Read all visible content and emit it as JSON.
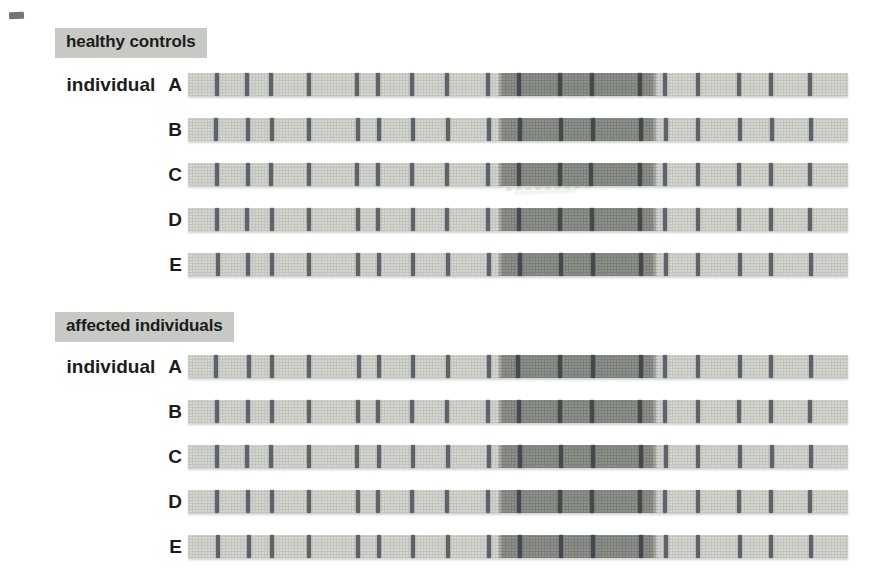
{
  "colors": {
    "page_bg": "#ffffff",
    "label_band_bg": "#c7c9c5",
    "text": "#1c1c1c",
    "bar_light": "#d4d6d0",
    "bar_halftone_dot": "rgba(70,75,66,0.13)",
    "block_dark": "#8e918c",
    "block_halftone_dot": "rgba(25,30,26,0.16)",
    "tick_light_region": "#5e6368",
    "tick_dark_region": "#45494d",
    "bar_shadow": "rgba(110,112,106,0.3)"
  },
  "sections": [
    {
      "label": "healthy controls",
      "row_prefix": "individual",
      "rows": [
        {
          "label": "A",
          "light_ticks_pct": [
            4.4,
            9.0,
            12.6,
            18.3,
            25.6,
            28.8,
            34.0,
            39.3,
            45.5,
            72.3,
            77.2,
            83.5,
            88.4,
            94.3
          ],
          "block": {
            "start_pct": 46.9,
            "end_pct": 71.0,
            "ticks_pct": [
              50.2,
              56.4,
              61.2,
              68.5
            ]
          }
        },
        {
          "label": "B",
          "light_ticks_pct": [
            4.3,
            9.1,
            12.7,
            18.4,
            25.7,
            28.9,
            34.1,
            39.4,
            45.6,
            72.4,
            77.3,
            83.6,
            88.5,
            94.4
          ],
          "block": {
            "start_pct": 47.0,
            "end_pct": 71.1,
            "ticks_pct": [
              50.3,
              56.5,
              61.3,
              68.6
            ]
          }
        },
        {
          "label": "C",
          "light_ticks_pct": [
            4.4,
            9.1,
            12.6,
            18.3,
            25.6,
            28.8,
            34.0,
            39.3,
            45.5,
            72.3,
            77.2,
            83.5,
            88.3,
            94.3
          ],
          "block": {
            "start_pct": 46.9,
            "end_pct": 71.0,
            "ticks_pct": [
              50.2,
              56.4,
              61.1,
              68.5
            ]
          }
        },
        {
          "label": "D",
          "light_ticks_pct": [
            4.4,
            9.0,
            12.7,
            18.3,
            25.7,
            28.8,
            34.1,
            39.3,
            45.5,
            72.3,
            77.2,
            83.5,
            88.4,
            94.3
          ],
          "block": {
            "start_pct": 46.9,
            "end_pct": 71.0,
            "ticks_pct": [
              50.2,
              56.3,
              61.2,
              68.5
            ]
          }
        },
        {
          "label": "E",
          "light_ticks_pct": [
            4.5,
            9.1,
            12.7,
            18.4,
            25.7,
            28.9,
            34.1,
            39.4,
            45.6,
            72.4,
            77.2,
            83.6,
            88.4,
            94.4
          ],
          "block": {
            "start_pct": 47.0,
            "end_pct": 71.1,
            "ticks_pct": [
              50.3,
              56.5,
              61.3,
              68.6
            ]
          }
        }
      ]
    },
    {
      "label": "affected individuals",
      "row_prefix": "individual",
      "rows": [
        {
          "label": "A",
          "light_ticks_pct": [
            4.3,
            9.2,
            12.8,
            18.4,
            25.9,
            28.9,
            34.1,
            39.4,
            45.6,
            72.3,
            77.2,
            83.6,
            88.4,
            94.4
          ],
          "block": {
            "start_pct": 47.0,
            "end_pct": 71.0,
            "ticks_pct": [
              50.0,
              56.4,
              61.3,
              68.6
            ]
          }
        },
        {
          "label": "B",
          "light_ticks_pct": [
            4.4,
            9.1,
            12.7,
            18.3,
            25.7,
            28.8,
            34.0,
            39.3,
            45.5,
            72.3,
            77.2,
            83.5,
            88.4,
            94.3
          ],
          "block": {
            "start_pct": 46.9,
            "end_pct": 71.0,
            "ticks_pct": [
              50.2,
              56.4,
              61.2,
              68.5
            ]
          }
        },
        {
          "label": "C",
          "light_ticks_pct": [
            4.4,
            9.0,
            12.6,
            18.4,
            25.6,
            28.9,
            34.1,
            39.4,
            45.6,
            72.4,
            77.3,
            83.6,
            88.5,
            94.4
          ],
          "block": {
            "start_pct": 47.0,
            "end_pct": 71.1,
            "ticks_pct": [
              50.3,
              56.5,
              61.3,
              68.6
            ]
          }
        },
        {
          "label": "D",
          "light_ticks_pct": [
            4.4,
            9.1,
            12.7,
            18.3,
            25.7,
            28.8,
            34.0,
            39.3,
            45.5,
            72.3,
            77.2,
            83.5,
            88.4,
            94.3
          ],
          "block": {
            "start_pct": 46.9,
            "end_pct": 71.0,
            "ticks_pct": [
              50.2,
              56.4,
              61.2,
              68.5
            ]
          }
        },
        {
          "label": "E",
          "light_ticks_pct": [
            4.5,
            9.2,
            12.8,
            18.4,
            25.8,
            28.9,
            34.1,
            39.4,
            45.6,
            72.4,
            77.2,
            83.6,
            88.4,
            94.4
          ],
          "block": {
            "start_pct": 47.0,
            "end_pct": 71.1,
            "ticks_pct": [
              50.3,
              56.5,
              61.3,
              68.6
            ]
          }
        }
      ]
    }
  ]
}
